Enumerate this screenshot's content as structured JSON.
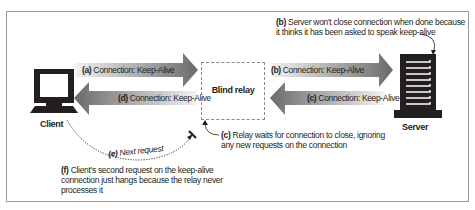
{
  "diagram": {
    "nodes": {
      "client": {
        "label": "Client",
        "icon": "computer-monitor-icon"
      },
      "relay": {
        "label": "Blind relay"
      },
      "server": {
        "label": "Server",
        "icon": "server-tower-icon"
      }
    },
    "arrows": {
      "a": {
        "tag": "(a)",
        "text": "Connection: Keep-Alive",
        "direction": "client-to-relay"
      },
      "d": {
        "tag": "(d)",
        "text": "Connection: Keep-Alive",
        "direction": "relay-to-client"
      },
      "b": {
        "tag": "(b)",
        "text": "Connection: Keep-Alive",
        "direction": "relay-to-server"
      },
      "c": {
        "tag": "(c)",
        "text": "Connection: Keep-Alive",
        "direction": "server-to-relay"
      },
      "e": {
        "tag": "(e)",
        "text": "Next request",
        "style": "dotted-curve",
        "direction": "client-to-relay-blocked"
      }
    },
    "notes": {
      "b": {
        "tag": "(b)",
        "line1": "Server won't close connection when done because",
        "line2": "it thinks it has been asked to speak keep-alive"
      },
      "c": {
        "tag": "(c)",
        "line1": "Relay waits for connection to close, ignoring",
        "line2": "any new requests on the connection"
      },
      "f": {
        "tag": "(f)",
        "line1": "Client's second request on the keep-alive",
        "line2": "connection just hangs because the relay never",
        "line3": "processes it"
      }
    },
    "colors": {
      "arrow_dark": "#6b6b6b",
      "arrow_light": "#e6e6e6",
      "icon_dark": "#231f20",
      "frame_border": "#9a9a9a",
      "relay_border": "#8a8a8a"
    }
  }
}
